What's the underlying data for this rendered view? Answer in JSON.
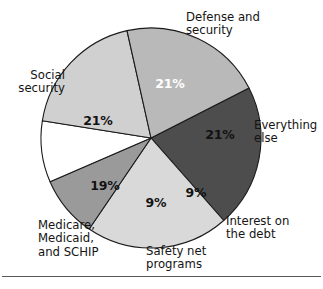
{
  "chart_data": {
    "type": "pie",
    "title": "",
    "subtitle": "",
    "xlabel": "",
    "ylabel": "",
    "legend_position": "none",
    "grid": false,
    "units": "percent",
    "total": 100,
    "start_angle_deg": -27,
    "direction": "clockwise",
    "categories": [
      "Defense and security",
      "Everything else",
      "Interest on the debt",
      "Safety net programs",
      "Medicare, Medicaid, and SCHIP",
      "Social security"
    ],
    "values": [
      21,
      21,
      9,
      9,
      19,
      21
    ],
    "value_labels": [
      "21%",
      "21%",
      "9%",
      "9%",
      "19%",
      "21%"
    ],
    "slice_colors": [
      "#4d4d4d",
      "#d9d9d9",
      "#9a9a9a",
      "#ffffff",
      "#d0d0d0",
      "#b9b9b9"
    ]
  },
  "slices": [
    {
      "key": "defense",
      "label_lines": [
        "Defense and",
        "security"
      ],
      "label_line1": "Defense and",
      "label_line2": "security",
      "value_label": "21%",
      "value": 21,
      "color": "#4d4d4d",
      "label_color": "#ffffff"
    },
    {
      "key": "everything-else",
      "label_lines": [
        "Everything",
        "else"
      ],
      "label_line1": "Everything",
      "label_line2": "else",
      "value_label": "21%",
      "value": 21,
      "color": "#d9d9d9",
      "label_color": "#121212"
    },
    {
      "key": "interest-on-the-debt",
      "label_lines": [
        "Interest on",
        "the debt"
      ],
      "label_line1": "Interest on",
      "label_line2": "the debt",
      "value_label": "9%",
      "value": 9,
      "color": "#9a9a9a",
      "label_color": "#121212"
    },
    {
      "key": "safety-net-programs",
      "label_lines": [
        "Safety net",
        "programs"
      ],
      "label_line1": "Safety net",
      "label_line2": "programs",
      "value_label": "9%",
      "value": 9,
      "color": "#ffffff",
      "label_color": "#121212"
    },
    {
      "key": "medicare-medicaid-schip",
      "label_lines": [
        "Medicare,",
        "Medicaid,",
        "and SCHIP"
      ],
      "label_line1": "Medicare,",
      "label_line2": "Medicaid,",
      "label_line3": "and SCHIP",
      "value_label": "19%",
      "value": 19,
      "color": "#d0d0d0",
      "label_color": "#121212"
    },
    {
      "key": "social-security",
      "label_lines": [
        "Social",
        "security"
      ],
      "label_line1": "Social",
      "label_line2": "security",
      "value_label": "21%",
      "value": 21,
      "color": "#b9b9b9",
      "label_color": "#121212"
    }
  ]
}
